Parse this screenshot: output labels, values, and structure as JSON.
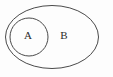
{
  "figure": {
    "type": "euler-diagram",
    "background_color": "#fdfdfd",
    "stroke_color": "#4a4a4a",
    "label_color": "#2b2b2b",
    "width": 113,
    "height": 77
  },
  "shapes": {
    "outer": {
      "name": "B",
      "kind": "ellipse",
      "cx": 52,
      "cy": 37,
      "rx": 46.5,
      "ry": 31.5
    },
    "inner": {
      "name": "A",
      "kind": "circle",
      "cx": 29,
      "cy": 37,
      "r": 19
    }
  },
  "labels": {
    "inner_set": "A",
    "outer_set": "B",
    "inner_x": 28,
    "inner_y": 36,
    "outer_x": 64,
    "outer_y": 36
  }
}
